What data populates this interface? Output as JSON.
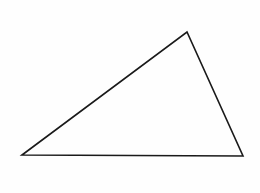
{
  "diagram": {
    "type": "triangle",
    "background": "#fefefe",
    "stroke_color": "#1a1a1a",
    "stroke_width": 1.6,
    "vertices": [
      {
        "name": "bottom-left",
        "x": 22,
        "y": 155
      },
      {
        "name": "top",
        "x": 187,
        "y": 32
      },
      {
        "name": "bottom-right",
        "x": 243,
        "y": 156
      }
    ]
  }
}
